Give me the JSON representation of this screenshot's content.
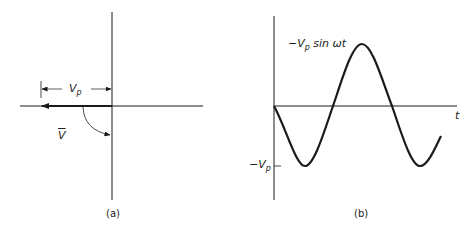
{
  "panel_a": {
    "caption": "(a)",
    "magnitude_label": "V",
    "magnitude_sub": "p",
    "phasor_label": "V"
  },
  "panel_b": {
    "caption": "(b)",
    "curve_label_prefix": "−V",
    "curve_label_sub": "p",
    "curve_label_suffix": " sin ωt",
    "y_tick_prefix": "−V",
    "y_tick_sub": "p",
    "x_axis_label": "t"
  },
  "colors": {
    "line": "#1a1a1a",
    "background": "#ffffff"
  }
}
